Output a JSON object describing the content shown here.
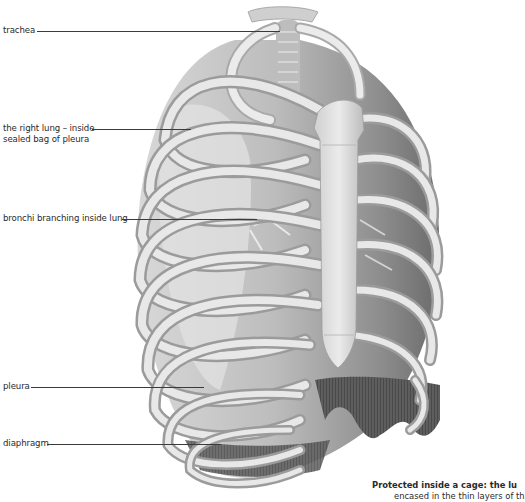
{
  "figure": {
    "labels": [
      {
        "id": "trachea",
        "text": "trachea"
      },
      {
        "id": "right-lung-line1",
        "text": "the right lung – inside"
      },
      {
        "id": "right-lung-line2",
        "text": "sealed bag of pleura"
      },
      {
        "id": "bronchi",
        "text": "bronchi branching inside lung"
      },
      {
        "id": "pleura",
        "text": "pleura"
      },
      {
        "id": "diaphragm",
        "text": "diaphragm"
      }
    ],
    "caption": {
      "line1": "Protected inside a cage: the lu",
      "line2": "encased in the thin layers of th"
    }
  },
  "colors": {
    "background": "#ffffff",
    "label_text": "#2a2a2a",
    "leader_line": "#3a3a3a",
    "bone_light": "#eeeeee",
    "bone_mid": "#c8c8c8",
    "bone_dark": "#8a8a8a",
    "cavity_dark": "#5a5a5a",
    "diaphragm_dark": "#3c3c3c"
  }
}
